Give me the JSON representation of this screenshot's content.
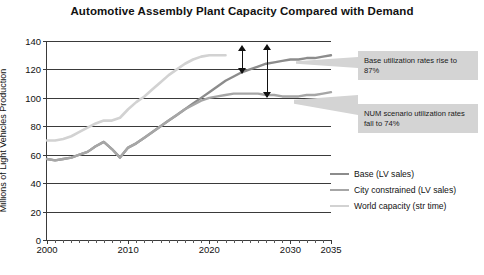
{
  "chart": {
    "title": "Automotive Assembly Plant Capacity Compared with Demand",
    "ylabel": "Millions of Light Vehicles Production",
    "xlabel": ""
  },
  "yticks": [
    "0",
    "20",
    "40",
    "60",
    "80",
    "100",
    "120",
    "140"
  ],
  "xticks": [
    "2000",
    "2010",
    "2020",
    "2030",
    "2035"
  ],
  "legend": [
    {
      "label": "Base (LV sales)",
      "color": "#8c8c8c"
    },
    {
      "label": "City constrained (LV sales)",
      "color": "#a6a6a6"
    },
    {
      "label": "World capacity (str time)",
      "color": "#d2d2d2"
    }
  ],
  "callouts": [
    {
      "id": "base",
      "text": "Base utilization rates rise to 87%"
    },
    {
      "id": "num",
      "text": "NUM scenario utilization rates fall to 74%"
    }
  ],
  "colors": {
    "base": "#8c8c8c",
    "city": "#a6a6a6",
    "capacity": "#d2d2d2",
    "axis": "#3a3a3a",
    "callout_bg": "#d4d4d4",
    "arrow": "#111111"
  },
  "chart_data": {
    "type": "line",
    "title": "Automotive Assembly Plant Capacity Compared with Demand",
    "xlabel": "",
    "ylabel": "Millions of Light Vehicles Production",
    "xlim": [
      2000,
      2035
    ],
    "ylim": [
      0,
      140
    ],
    "ytick_values": [
      0,
      20,
      40,
      60,
      80,
      100,
      120,
      140
    ],
    "xtick_values": [
      2000,
      2010,
      2020,
      2030,
      2035
    ],
    "grid": "horizontal",
    "legend_position": "right",
    "series": [
      {
        "name": "Base (LV sales)",
        "color": "#8c8c8c",
        "x": [
          2000,
          2001,
          2002,
          2003,
          2004,
          2005,
          2006,
          2007,
          2008,
          2009,
          2010,
          2011,
          2012,
          2013,
          2014,
          2015,
          2016,
          2017,
          2018,
          2019,
          2020,
          2021,
          2022,
          2023,
          2024,
          2025,
          2026,
          2027,
          2028,
          2029,
          2030,
          2031,
          2032,
          2033,
          2034,
          2035
        ],
        "y": [
          57,
          56,
          57,
          58,
          60,
          62,
          66,
          69,
          64,
          58,
          65,
          68,
          72,
          76,
          80,
          84,
          88,
          92,
          96,
          100,
          104,
          108,
          112,
          115,
          118,
          120,
          122,
          124,
          125,
          126,
          127,
          127,
          128,
          128,
          129,
          130
        ]
      },
      {
        "name": "City constrained (LV sales)",
        "color": "#a6a6a6",
        "x": [
          2000,
          2001,
          2002,
          2003,
          2004,
          2005,
          2006,
          2007,
          2008,
          2009,
          2010,
          2011,
          2012,
          2013,
          2014,
          2015,
          2016,
          2017,
          2018,
          2019,
          2020,
          2021,
          2022,
          2023,
          2024,
          2025,
          2026,
          2027,
          2028,
          2029,
          2030,
          2031,
          2032,
          2033,
          2034,
          2035
        ],
        "y": [
          57,
          56,
          57,
          58,
          60,
          62,
          66,
          69,
          64,
          58,
          65,
          68,
          72,
          76,
          80,
          84,
          88,
          92,
          95,
          98,
          100,
          101,
          102,
          103,
          103,
          103,
          103,
          102,
          102,
          101,
          101,
          101,
          102,
          102,
          103,
          104
        ]
      },
      {
        "name": "World capacity (str time)",
        "color": "#d2d2d2",
        "x": [
          2000,
          2001,
          2002,
          2003,
          2004,
          2005,
          2006,
          2007,
          2008,
          2009,
          2010,
          2011,
          2012,
          2013,
          2014,
          2015,
          2016,
          2017,
          2018,
          2019,
          2020,
          2021,
          2022
        ],
        "y": [
          70,
          70,
          71,
          73,
          76,
          79,
          82,
          84,
          84,
          86,
          92,
          97,
          101,
          106,
          111,
          116,
          120,
          124,
          127,
          129,
          130,
          130,
          130
        ]
      }
    ],
    "annotations": [
      {
        "text": "Base utilization rates rise to 87%",
        "x": 2030,
        "y": 125
      },
      {
        "text": "NUM scenario utilization rates fall to 74%",
        "x": 2030,
        "y": 101
      },
      {
        "text": "arrow-capacity-to-base",
        "type": "double-arrow",
        "x": 2025,
        "y_from": 130,
        "y_to": 122
      },
      {
        "text": "arrow-capacity-to-city",
        "type": "double-arrow",
        "x": 2028,
        "y_from": 133,
        "y_to": 101
      }
    ]
  }
}
